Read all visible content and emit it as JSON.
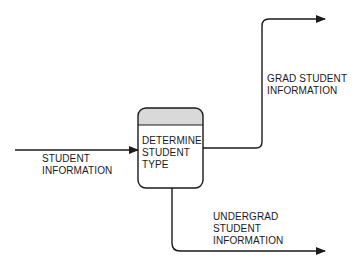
{
  "diagram": {
    "type": "data-flow-diagram",
    "process": {
      "label_lines": [
        "DETERMINE",
        "STUDENT",
        "TYPE"
      ],
      "header_fill": "#d9d9d9"
    },
    "flows": [
      {
        "id": "input",
        "label_lines": [
          "STUDENT",
          "INFORMATION"
        ],
        "direction": "in"
      },
      {
        "id": "grad",
        "label_lines": [
          "GRAD STUDENT",
          "INFORMATION"
        ],
        "direction": "out"
      },
      {
        "id": "undergrad",
        "label_lines": [
          "UNDERGRAD",
          "STUDENT",
          "INFORMATION"
        ],
        "direction": "out"
      }
    ],
    "colors": {
      "stroke": "#1a1a1a",
      "text": "#1a1a1a",
      "background": "#ffffff"
    }
  }
}
